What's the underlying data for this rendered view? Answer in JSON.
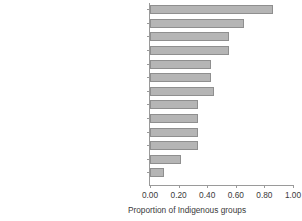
{
  "chart_data": {
    "type": "bar",
    "orientation": "horizontal",
    "title": "",
    "xlabel": "Proportion of Indigenous groups",
    "ylabel": "",
    "xlim": [
      0,
      1
    ],
    "xticks": [
      "0.00",
      "0.20",
      "0.40",
      "0.60",
      "0.80",
      "1.00"
    ],
    "xtick_values": [
      0,
      0.2,
      0.4,
      0.6,
      0.8,
      1.0
    ],
    "grid": false,
    "legend": null,
    "bar_color": "#b5b5b5",
    "bar_edge_color": "#8f8f8f",
    "axis_color": "#9a9a9a",
    "categories": [
      "Livelihood programs",
      "Restore/revitalize indigenous culture",
      "Education/literacy programs",
      "Infrastructure projects",
      "Account of Indigenous knowledge",
      "Health programs",
      "Forest guard engagement projects",
      "Women and youth programs",
      "Means to create income with investors",
      "Biodiversity conservation programs",
      "Forest restoration projects",
      "Skills program",
      "Others"
    ],
    "values": [
      0.86,
      0.66,
      0.55,
      0.55,
      0.43,
      0.43,
      0.45,
      0.335,
      0.335,
      0.335,
      0.335,
      0.22,
      0.1
    ]
  }
}
